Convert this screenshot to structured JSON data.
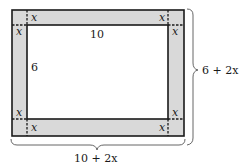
{
  "diagram": {
    "type": "rectangle-with-border",
    "colors": {
      "border_fill": "#d9d9d9",
      "inner_fill": "#ffffff",
      "stroke": "#1a1a1a"
    },
    "inner_rectangle": {
      "width_label": "10",
      "height_label": "6"
    },
    "border_width_labels": {
      "top_left_horizontal": "x",
      "top_left_vertical": "x",
      "top_right_horizontal": "x",
      "top_right_vertical": "x",
      "bottom_left_horizontal": "x",
      "bottom_left_vertical": "x",
      "bottom_right_horizontal": "x",
      "bottom_right_vertical": "x"
    },
    "outer_dimensions": {
      "height_label": "6 + 2x",
      "width_label": "10 + 2x"
    }
  }
}
